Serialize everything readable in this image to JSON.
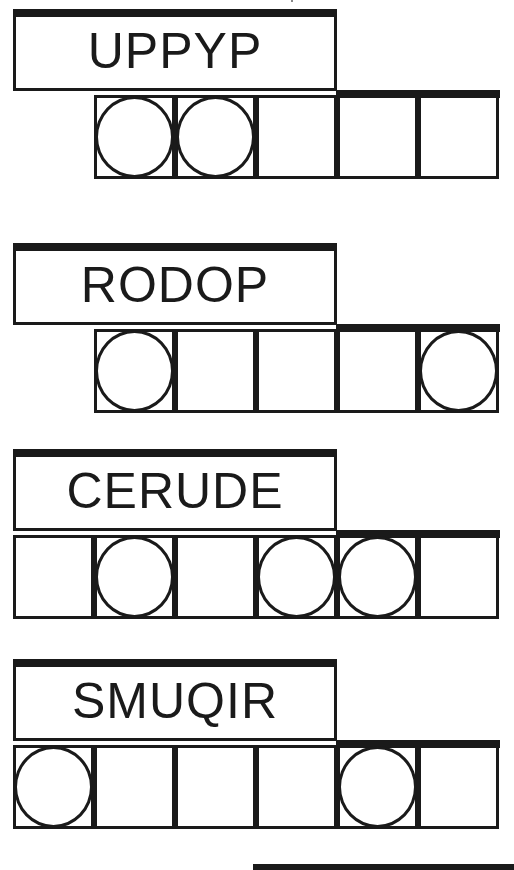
{
  "puzzles": [
    {
      "scrambled": "UPPYP",
      "top": 9,
      "cell_count": 5,
      "start_col": 1,
      "circled": [
        0,
        1
      ]
    },
    {
      "scrambled": "RODOP",
      "top": 243,
      "cell_count": 5,
      "start_col": 1,
      "circled": [
        0,
        4
      ]
    },
    {
      "scrambled": "CERUDE",
      "top": 449,
      "cell_count": 6,
      "start_col": 0,
      "circled": [
        1,
        3,
        4
      ]
    },
    {
      "scrambled": "SMUQIR",
      "top": 659,
      "cell_count": 6,
      "start_col": 0,
      "circled": [
        0,
        4
      ]
    }
  ],
  "colors": {
    "ink": "#1a1a1a",
    "paper": "#ffffff"
  }
}
